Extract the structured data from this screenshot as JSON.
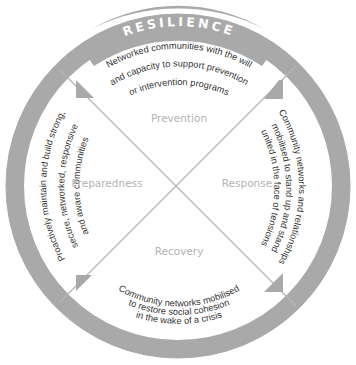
{
  "diagram": {
    "title": "RESILIENCE",
    "colors": {
      "ring": "#a9a9a9",
      "lines": "#b5b5b5",
      "arrows": "#a9a9a9",
      "quadrant_label": "#b3b3b3",
      "description_text": "#333333",
      "title_text": "#ffffff",
      "background": "#ffffff"
    },
    "quadrants": {
      "top": {
        "label": "Prevention",
        "description": [
          "Networked communities with the will",
          "and capacity to support prevention",
          "or intervention programs"
        ]
      },
      "right": {
        "label": "Response",
        "description": [
          "Community networks and relationships",
          "mobilised to stand up and stand",
          "united in the face of tensions"
        ]
      },
      "bottom": {
        "label": "Recovery",
        "description": [
          "Community networks mobilised",
          "to restore social cohesion",
          "in the wake of a crisis"
        ]
      },
      "left": {
        "label": "Preparedness",
        "description": [
          "Proactively maintain and build strong,",
          "secure, networked, responsive",
          "and aware communities"
        ]
      }
    }
  }
}
